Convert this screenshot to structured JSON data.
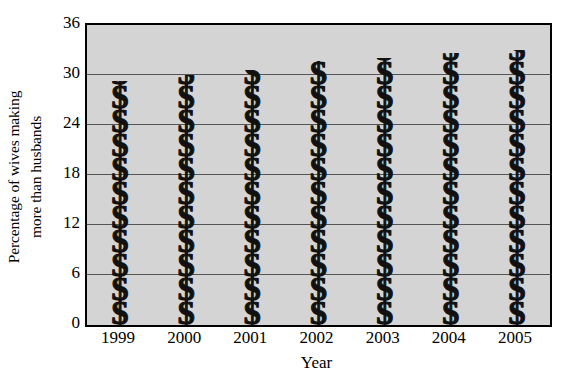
{
  "chart_data": {
    "type": "bar",
    "title": "",
    "xlabel": "Year",
    "ylabel": "Percentage of wives making more than husbands",
    "ylabel_lines": [
      "Percentage of wives making",
      "more than husbands"
    ],
    "categories": [
      "1999",
      "2000",
      "2001",
      "2002",
      "2003",
      "2004",
      "2005"
    ],
    "values": [
      29.3,
      30.0,
      30.6,
      31.7,
      32.0,
      32.6,
      33.0
    ],
    "ylim": [
      0,
      36
    ],
    "yticks": [
      0,
      6,
      12,
      18,
      24,
      30,
      36
    ],
    "ytick_labels": [
      "0",
      "6",
      "12",
      "18",
      "24",
      "30",
      "36"
    ],
    "grid": true,
    "legend": "none",
    "marker_glyph": "$",
    "marker_name": "dollar-sign-pictograph",
    "plot_background": "#d4d4d4",
    "bar_color": "#111111",
    "gridline_color": "#555555",
    "axis_color": "#000000"
  }
}
